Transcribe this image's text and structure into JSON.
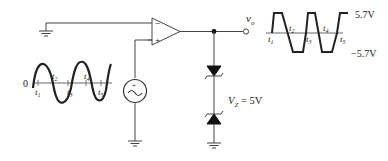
{
  "diagram": {
    "type": "op-amp comparator with back-to-back zener output limiter",
    "components": {
      "opamp": {
        "inverting_label": "−",
        "noninverting_label": "+"
      },
      "source": {
        "symbol": "~",
        "polarity": "+"
      },
      "zener_top": {
        "orientation": "cathode-down"
      },
      "zener_bottom": {
        "label_prefix": "V",
        "label_sub": "Z",
        "label_value": " = 5V"
      },
      "output": {
        "label_main": "v",
        "label_sub": "o"
      }
    },
    "input_waveform": {
      "zero_label": "0",
      "time_labels": [
        {
          "t": "t",
          "n": "1"
        },
        {
          "t": "t",
          "n": "2"
        },
        {
          "t": "t",
          "n": "3"
        },
        {
          "t": "t",
          "n": "4"
        },
        {
          "t": "t",
          "n": "5"
        }
      ]
    },
    "output_waveform": {
      "high_label": "5.7V",
      "low_label": "−5.7V",
      "time_labels": [
        {
          "t": "t",
          "n": "1"
        },
        {
          "t": "t",
          "n": "2"
        },
        {
          "t": "t",
          "n": "3"
        },
        {
          "t": "t",
          "n": "4"
        },
        {
          "t": "t",
          "n": "5"
        }
      ]
    },
    "colors": {
      "line": "#333333",
      "wave": "#222222",
      "background": "#ffffff"
    }
  }
}
